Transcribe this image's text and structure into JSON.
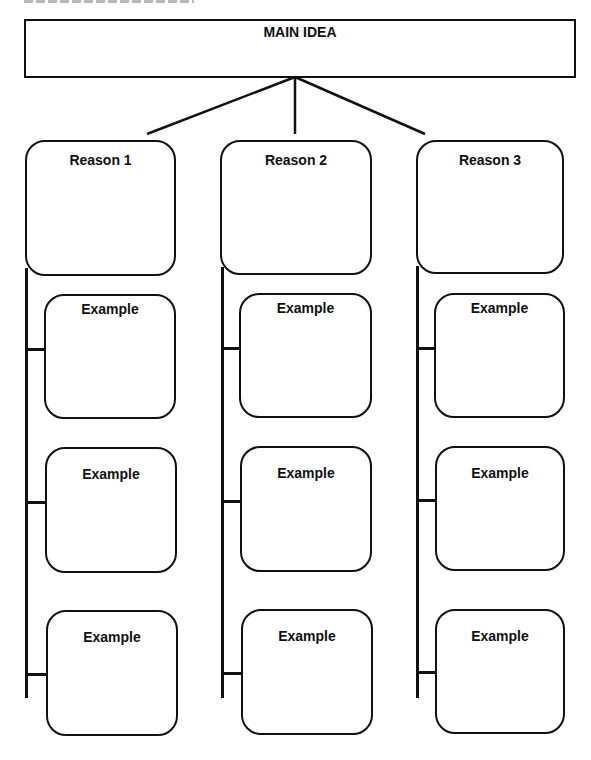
{
  "diagram": {
    "type": "graphic-organizer",
    "main_idea": {
      "label": "MAIN IDEA"
    },
    "reasons": [
      {
        "label": "Reason 1",
        "examples": [
          {
            "label": "Example"
          },
          {
            "label": "Example"
          },
          {
            "label": "Example"
          }
        ]
      },
      {
        "label": "Reason 2",
        "examples": [
          {
            "label": "Example"
          },
          {
            "label": "Example"
          },
          {
            "label": "Example"
          }
        ]
      },
      {
        "label": "Reason 3",
        "examples": [
          {
            "label": "Example"
          },
          {
            "label": "Example"
          },
          {
            "label": "Example"
          }
        ]
      }
    ],
    "colors": {
      "stroke": "#111111",
      "background": "#ffffff",
      "text": "#111111"
    }
  }
}
